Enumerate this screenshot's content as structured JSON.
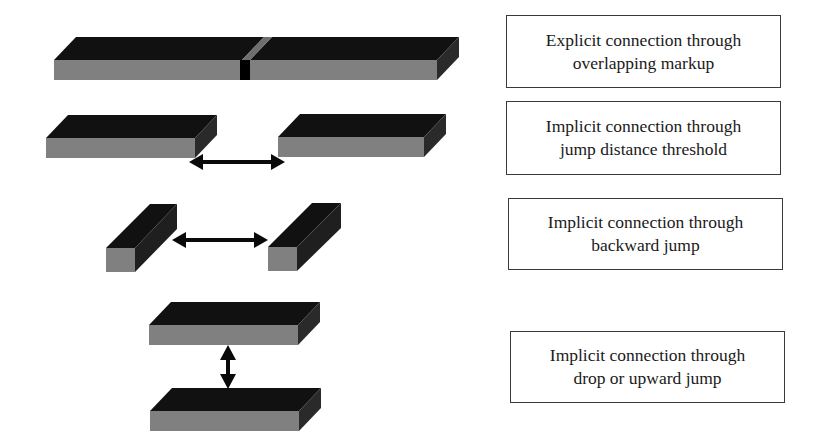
{
  "colors": {
    "top_face": "#111111",
    "front_face": "#808080",
    "side_face": "#2a2a2a",
    "arrow": "#0a0a0a",
    "overlap_marker": "#000000",
    "overlap_stripe": "#6e6e6e",
    "box_border": "#3a3a3a",
    "text": "#1a1a1a",
    "background": "#ffffff"
  },
  "rows": [
    {
      "id": "explicit-overlap",
      "label_line1": "Explicit connection through",
      "label_line2": "overlapping markup",
      "illustration": "single long bar split by an overlap marker"
    },
    {
      "id": "jump-distance-threshold",
      "label_line1": "Implicit connection through",
      "label_line2": "jump distance threshold",
      "illustration": "two horizontal bars with a horizontal double-headed arrow between them"
    },
    {
      "id": "backward-jump",
      "label_line1": "Implicit connection through",
      "label_line2": "backward jump",
      "illustration": "two short deep blocks with a horizontal double-headed arrow between them"
    },
    {
      "id": "drop-upward-jump",
      "label_line1": "Implicit connection through",
      "label_line2": "drop or upward jump",
      "illustration": "two stacked bars with a vertical double-headed arrow between them"
    }
  ]
}
